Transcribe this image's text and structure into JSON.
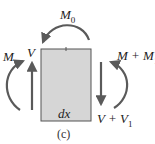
{
  "diagram": {
    "type": "free-body diagram of beam element",
    "element": {
      "label": "dx",
      "fill": "#d6d6d6",
      "stroke": "#555555"
    },
    "forces": {
      "left_shear": {
        "label": "V",
        "direction": "up"
      },
      "right_shear": {
        "label": "V + V",
        "sub": "1",
        "direction": "down"
      },
      "left_moment": {
        "label": "M",
        "direction": "clockwise"
      },
      "right_moment": {
        "label": "M + M",
        "sub": "1",
        "direction": "counterclockwise"
      },
      "applied_moment": {
        "label": "M",
        "sub": "0",
        "direction": "counterclockwise"
      }
    },
    "caption": "(c)",
    "arrow_color": "#5a5a5a"
  }
}
